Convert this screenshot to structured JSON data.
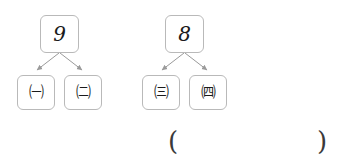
{
  "worksheet": {
    "type": "number-bond",
    "groups": [
      {
        "id": "group-left",
        "parent": "9",
        "children": [
          "㈠",
          "㈡"
        ]
      },
      {
        "id": "group-right",
        "parent": "8",
        "children": [
          "㈢",
          "㈣"
        ]
      }
    ],
    "answer": {
      "open_paren": "(",
      "close_paren": ")",
      "value": "",
      "placeholder": ""
    }
  },
  "colors": {
    "box_border": "#b9b9b9",
    "box_fill": "#ffffff",
    "arrow": "#9a9a9a",
    "text": "#1a1a1a",
    "paren": "#3a3a3a",
    "page_background": "#ffffff"
  }
}
